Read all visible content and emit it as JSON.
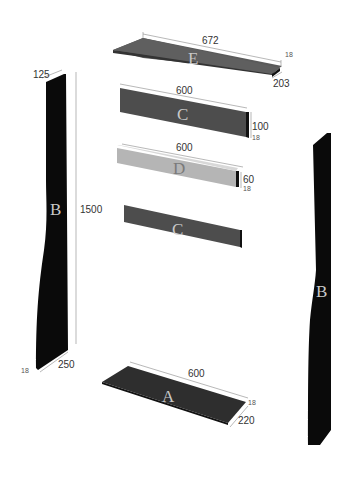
{
  "diagram": {
    "colors": {
      "panel_dark": "#555555",
      "panel_black": "#111111",
      "panel_light": "#b8b8b8",
      "letter": "#c8c8c8",
      "dimension_text": "#333333"
    },
    "panels": [
      {
        "id": "E",
        "label": "E",
        "length": "672",
        "depth": "203",
        "thickness": "18"
      },
      {
        "id": "C1",
        "label": "C",
        "length": "600",
        "height": "100",
        "thickness": "18"
      },
      {
        "id": "D",
        "label": "D",
        "length": "600",
        "height": "60",
        "thickness": "18"
      },
      {
        "id": "C2",
        "label": "C"
      },
      {
        "id": "A",
        "label": "A",
        "length": "600",
        "depth": "220",
        "thickness": "18"
      },
      {
        "id": "B_left",
        "label": "B",
        "height": "1500",
        "top_width": "125",
        "bottom_width": "250",
        "thickness": "18"
      },
      {
        "id": "B_right",
        "label": "B"
      }
    ]
  }
}
